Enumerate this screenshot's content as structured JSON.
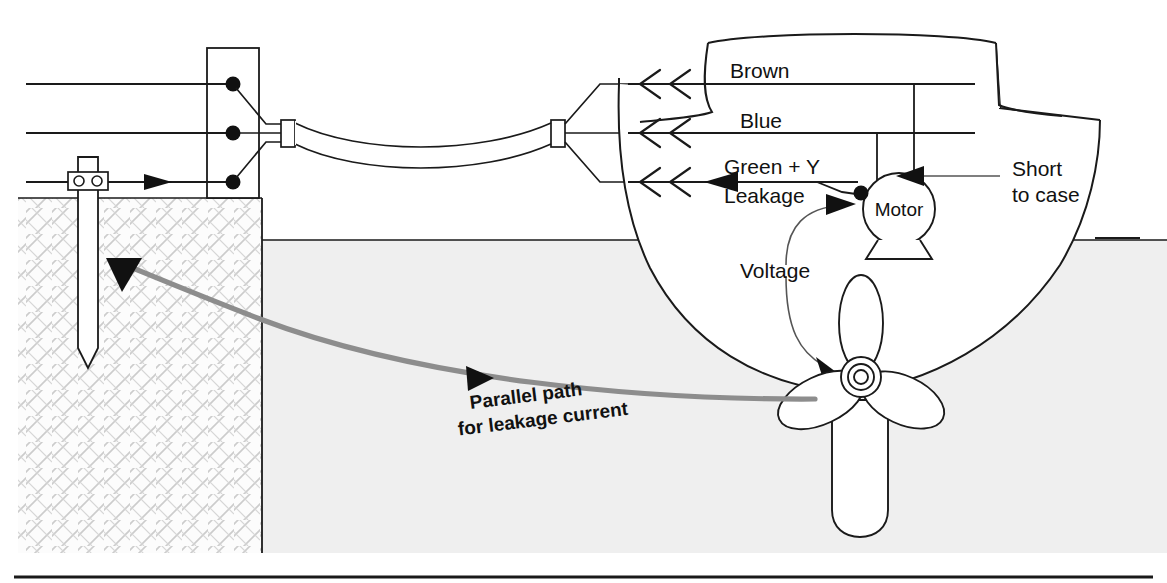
{
  "diagram": {
    "canvas": {
      "width": 1167,
      "height": 583
    },
    "colors": {
      "ink": "#1a1a1a",
      "leakage_path": "#8d8d8d",
      "water_fill": "#efefef",
      "land_fill": "#fbfbfb",
      "hatch": "#c9c9c9",
      "background": "#ffffff"
    }
  },
  "labels": {
    "brown": "Brown",
    "blue": "Blue",
    "green_yellow": "Green + Y",
    "leakage": "Leakage",
    "short_to_case_line1": "Short",
    "short_to_case_line2": "to case",
    "motor": "Motor",
    "voltage": "Voltage",
    "parallel_path_line1": "Parallel path",
    "parallel_path_line2": "for leakage current"
  },
  "elements": {
    "shore_post": "shore-power-pedestal",
    "earth_rod": "earth-ground-rod",
    "earth_clamp": "earth-rod-clamp",
    "shore_cable": "shore-power-cable",
    "hull": "boat-hull",
    "deckhouse": "boat-deckhouse",
    "motor_body": "motor-circle",
    "motor_base": "motor-mount",
    "propeller": "propeller",
    "prop_hub": "propeller-hub",
    "skeg": "skeg-rudder",
    "water": "water-region",
    "land": "land-region",
    "quay": "quay-wall",
    "bottom_rule": "figure-bottom-rule"
  },
  "conductors": [
    {
      "name": "brown-conductor",
      "label": "Brown",
      "y": 84,
      "flow": "toward-shore",
      "chevrons": 2,
      "solid_arrow": false
    },
    {
      "name": "blue-conductor",
      "label": "Blue",
      "y": 133,
      "flow": "toward-shore",
      "chevrons": 2,
      "solid_arrow": false
    },
    {
      "name": "earth-conductor",
      "label": "Green + Y",
      "y": 182,
      "flow": "toward-shore",
      "chevrons": 2,
      "solid_arrow": true
    }
  ],
  "annotations": [
    {
      "name": "short-to-case-callout",
      "text": "Short to case",
      "target": "motor-case"
    },
    {
      "name": "voltage-callout",
      "text": "Voltage",
      "targets": [
        "motor-case",
        "propeller"
      ]
    },
    {
      "name": "parallel-path-callout",
      "text": "Parallel path for leakage current",
      "target": "earth-ground-rod"
    }
  ]
}
